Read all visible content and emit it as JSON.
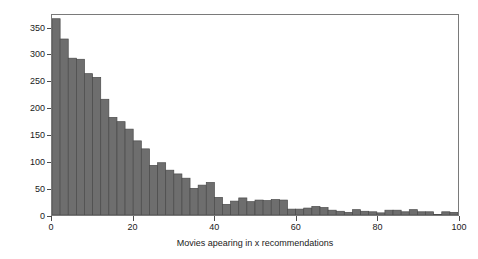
{
  "chart_data": {
    "type": "bar",
    "title": "",
    "xlabel": "Movies apearing in x recommendations",
    "ylabel": "Number of movies",
    "xlim": [
      0,
      100
    ],
    "ylim": [
      0,
      375
    ],
    "grid": false,
    "legend": null,
    "bin_width": 2,
    "bar_color": "#6e6e6e",
    "bar_edge_color": "#4a4a4a",
    "frame_color": "#7a7a7a",
    "background_color": "#ffffff",
    "xticks": [
      0,
      20,
      40,
      60,
      80,
      100
    ],
    "xtick_labels": [
      "0",
      "20",
      "40",
      "60",
      "80",
      "100"
    ],
    "yticks": [
      0,
      50,
      100,
      150,
      200,
      250,
      300,
      350
    ],
    "ytick_labels": [
      "0",
      "50",
      "100",
      "150",
      "200",
      "250",
      "300",
      "350"
    ],
    "categories": [
      1,
      3,
      5,
      7,
      9,
      11,
      13,
      15,
      17,
      19,
      21,
      23,
      25,
      27,
      29,
      31,
      33,
      35,
      37,
      39,
      41,
      43,
      45,
      47,
      49,
      51,
      53,
      55,
      57,
      59,
      61,
      63,
      65,
      67,
      69,
      71,
      73,
      75,
      77,
      79,
      81,
      83,
      85,
      87,
      89,
      91,
      93,
      95,
      97,
      99
    ],
    "bin_edges": [
      0,
      2,
      4,
      6,
      8,
      10,
      12,
      14,
      16,
      18,
      20,
      22,
      24,
      26,
      28,
      30,
      32,
      34,
      36,
      38,
      40,
      42,
      44,
      46,
      48,
      50,
      52,
      54,
      56,
      58,
      60,
      62,
      64,
      66,
      68,
      70,
      72,
      74,
      76,
      78,
      80,
      82,
      84,
      86,
      88,
      90,
      92,
      94,
      96,
      98,
      100
    ],
    "values": [
      368,
      330,
      294,
      292,
      265,
      258,
      217,
      183,
      175,
      161,
      139,
      124,
      93,
      98,
      84,
      77,
      69,
      50,
      56,
      61,
      33,
      20,
      26,
      32,
      25,
      28,
      27,
      29,
      28,
      11,
      11,
      13,
      16,
      14,
      9,
      7,
      5,
      10,
      7,
      6,
      4,
      9,
      9,
      6,
      10,
      6,
      6,
      1,
      6,
      5
    ]
  }
}
